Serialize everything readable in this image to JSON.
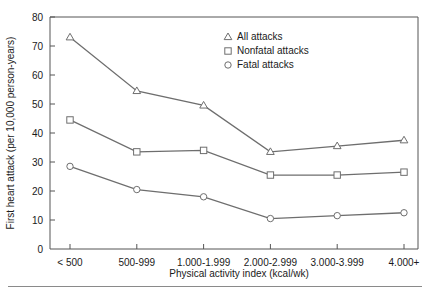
{
  "chart_data": {
    "type": "line",
    "title": "",
    "xlabel": "Physical activity index (kcal/wk)",
    "ylabel": "First heart attack (per 10,000 person-years)",
    "categories": [
      "< 500",
      "500-999",
      "1.000-1.999",
      "2.000-2.999",
      "3.000-3.999",
      "4.000+"
    ],
    "ylim": [
      0,
      80
    ],
    "yticks": [
      0,
      10,
      20,
      30,
      40,
      50,
      60,
      70,
      80
    ],
    "ytick_labels": [
      "0",
      "10",
      "20",
      "30",
      "40",
      "50",
      "60",
      "70",
      "80"
    ],
    "grid": false,
    "legend_position": "top-right",
    "series": [
      {
        "name": "All attacks",
        "marker": "triangle",
        "values": [
          73,
          54.5,
          49.5,
          33.5,
          35.5,
          37.5
        ]
      },
      {
        "name": "Nonfatal attacks",
        "marker": "square",
        "values": [
          44.5,
          33.5,
          34,
          25.5,
          25.5,
          26.5
        ]
      },
      {
        "name": "Fatal attacks",
        "marker": "circle",
        "values": [
          28.5,
          20.5,
          18,
          10.5,
          11.5,
          12.5
        ]
      }
    ],
    "colors": {
      "line": "#6e6e6e",
      "axis": "#555555",
      "marker_fill": "#ffffff",
      "text": "#1a1a1a"
    }
  }
}
